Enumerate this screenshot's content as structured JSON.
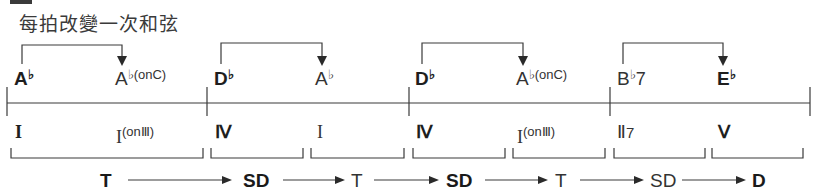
{
  "header": {
    "title": "每拍改變一次和弦"
  },
  "measures": [
    {
      "chords": [
        {
          "root": "A",
          "accidental": "♭",
          "suffix": "",
          "bold": true
        },
        {
          "root": "A",
          "accidental": "♭",
          "suffix": "(onC)",
          "bold": false
        }
      ],
      "roman": [
        {
          "numeral": "I",
          "suffix": "",
          "bold": true
        },
        {
          "numeral": "I",
          "suffix": "(onⅢ)",
          "bold": false
        }
      ]
    },
    {
      "chords": [
        {
          "root": "D",
          "accidental": "♭",
          "suffix": "",
          "bold": true
        },
        {
          "root": "A",
          "accidental": "♭",
          "suffix": "",
          "bold": false
        }
      ],
      "roman": [
        {
          "numeral": "Ⅳ",
          "suffix": "",
          "bold": true
        },
        {
          "numeral": "I",
          "suffix": "",
          "bold": false
        }
      ]
    },
    {
      "chords": [
        {
          "root": "D",
          "accidental": "♭",
          "suffix": "",
          "bold": true
        },
        {
          "root": "A",
          "accidental": "♭",
          "suffix": "(onC)",
          "bold": false
        }
      ],
      "roman": [
        {
          "numeral": "Ⅳ",
          "suffix": "",
          "bold": true
        },
        {
          "numeral": "I",
          "suffix": "(onⅢ)",
          "bold": false
        }
      ]
    },
    {
      "chords": [
        {
          "root": "B",
          "accidental": "♭",
          "suffix": "7",
          "bold": false
        },
        {
          "root": "E",
          "accidental": "♭",
          "suffix": "",
          "bold": true
        }
      ],
      "roman": [
        {
          "numeral": "Ⅱ",
          "suffix": "7",
          "bold": false
        },
        {
          "numeral": "Ⅴ",
          "suffix": "",
          "bold": true
        }
      ]
    }
  ],
  "functions": [
    {
      "label": "T",
      "bold": true
    },
    {
      "label": "SD",
      "bold": true
    },
    {
      "label": "T",
      "bold": false
    },
    {
      "label": "SD",
      "bold": true
    },
    {
      "label": "T",
      "bold": false
    },
    {
      "label": "SD",
      "bold": false
    },
    {
      "label": "D",
      "bold": true
    }
  ]
}
